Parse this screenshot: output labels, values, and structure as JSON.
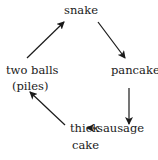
{
  "diagram": {
    "type": "cycle",
    "nodes": [
      {
        "id": "snake",
        "label": "snake"
      },
      {
        "id": "pancake",
        "label": "pancake"
      },
      {
        "id": "sausage",
        "label": "sausage"
      },
      {
        "id": "thick_cake",
        "label_line1": "thick",
        "label_line2": "cake"
      },
      {
        "id": "two_balls",
        "label_line1": "two balls",
        "label_line2": "(piles)"
      }
    ],
    "edges": [
      {
        "from": "snake",
        "to": "pancake"
      },
      {
        "from": "pancake",
        "to": "sausage"
      },
      {
        "from": "sausage",
        "to": "thick_cake"
      },
      {
        "from": "thick_cake",
        "to": "two_balls"
      },
      {
        "from": "two_balls",
        "to": "snake"
      }
    ],
    "colors": {
      "text": "#1a1a1a",
      "arrow": "#1a1a1a",
      "background": "#ffffff"
    }
  }
}
